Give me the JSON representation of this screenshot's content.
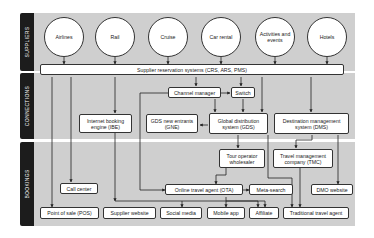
{
  "bands": [
    {
      "label": "SUPPLIERS"
    },
    {
      "label": "CONNECTIONS"
    },
    {
      "label": "BOOKINGS"
    }
  ],
  "suppliers": [
    {
      "label": "Airlines"
    },
    {
      "label": "Rail"
    },
    {
      "label": "Cruise"
    },
    {
      "label": "Car rental"
    },
    {
      "label": "Activities and events"
    },
    {
      "label": "Hotels"
    }
  ],
  "connections": {
    "reservation_systems": "Supplier reservation systems (CRS, ARS, PMS)",
    "channel_manager": "Channel manager",
    "switch": "Switch",
    "ibe": "Internet booking engine (IBE)",
    "gne": "GDS new entrants (GNE)",
    "gds": "Global distribution system (GDS)",
    "dms": "Destination management system (DMS)"
  },
  "bookings": {
    "tour_operator": "Tour operator wholesaler",
    "tmc": "Travel management company (TMC)",
    "call_center": "Call center",
    "ota": "Online travel agent (OTA)",
    "meta_search": "Meta-search",
    "dmo_website": "DMO website",
    "pos": "Point of sale (POS)",
    "supplier_website": "Supplier website",
    "social_media": "Social media",
    "mobile_app": "Mobile app",
    "affiliate": "Affiliate",
    "traditional_agent": "Traditional travel agent"
  }
}
